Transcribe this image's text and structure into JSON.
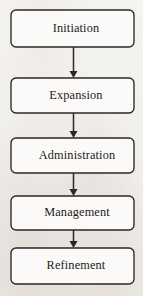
{
  "diagram": {
    "title": "",
    "type": "vertical-flowchart",
    "orientation": "top-to-bottom",
    "canvas": {
      "width": 143,
      "height": 296
    },
    "colors": {
      "background": "#f4f2ef",
      "box_fill": "#fbfaf8",
      "box_stroke": "#2a2826",
      "text": "#1d1b1a",
      "arrow": "#2a2826"
    },
    "nodes": [
      {
        "id": "initiation",
        "label": "Initiation",
        "x": 11,
        "y": 10,
        "w": 123,
        "h": 37,
        "rx": 5,
        "text_x": 76,
        "text_y": 28.5
      },
      {
        "id": "expansion",
        "label": "Expansion",
        "x": 11,
        "y": 78,
        "w": 123,
        "h": 35,
        "rx": 5,
        "text_x": 76,
        "text_y": 95.5
      },
      {
        "id": "administration",
        "label": "Administration",
        "x": 11,
        "y": 138,
        "w": 123,
        "h": 35,
        "rx": 5,
        "text_x": 77,
        "text_y": 155.5
      },
      {
        "id": "management",
        "label": "Management",
        "x": 11,
        "y": 196,
        "w": 123,
        "h": 34,
        "rx": 5,
        "text_x": 77,
        "text_y": 213
      },
      {
        "id": "refinement",
        "label": "Refinement",
        "x": 11,
        "y": 248,
        "w": 123,
        "h": 36,
        "rx": 5,
        "text_x": 76,
        "text_y": 266
      }
    ],
    "edges": [
      {
        "id": "initiation-to-expansion",
        "from": "initiation",
        "to": "expansion",
        "x": 73.5,
        "y1": 47,
        "y2": 78
      },
      {
        "id": "expansion-to-administration",
        "from": "expansion",
        "to": "administration",
        "x": 73.5,
        "y1": 113,
        "y2": 138
      },
      {
        "id": "administration-to-management",
        "from": "administration",
        "to": "management",
        "x": 73.5,
        "y1": 173,
        "y2": 196
      },
      {
        "id": "management-to-refinement",
        "from": "management",
        "to": "refinement",
        "x": 73.5,
        "y1": 230,
        "y2": 248
      }
    ]
  }
}
